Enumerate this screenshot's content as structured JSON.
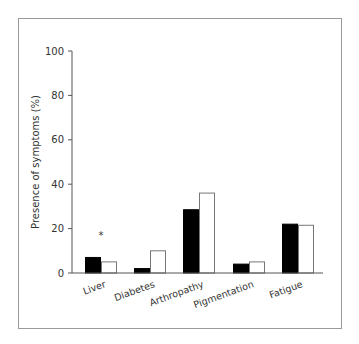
{
  "chart_data": {
    "type": "bar",
    "title": "",
    "xlabel": "",
    "ylabel": "Presence of symptoms (%)",
    "ylim": [
      0,
      100
    ],
    "yticks": [
      0,
      20,
      40,
      60,
      80,
      100
    ],
    "grid": false,
    "legend": null,
    "categories": [
      "Liver",
      "Diabetes",
      "Arthropathy",
      "Pigmentation",
      "Fatigue"
    ],
    "series": [
      {
        "name": "Group 1 (black)",
        "color": "#000000",
        "values": [
          7,
          2,
          28.5,
          4,
          22
        ]
      },
      {
        "name": "Group 2 (white)",
        "color": "#ffffff",
        "values": [
          5,
          10,
          36,
          5,
          21.5
        ]
      }
    ],
    "annotations": [
      {
        "category": "Liver",
        "text": "*"
      }
    ]
  }
}
